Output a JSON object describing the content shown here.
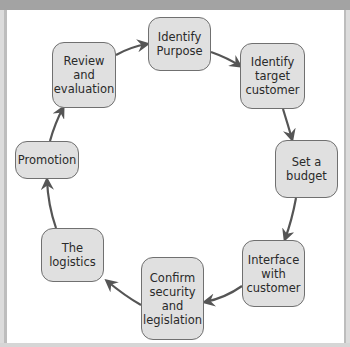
{
  "diagram": {
    "type": "cycle",
    "header_text": "",
    "nodes": [
      {
        "id": "identify-purpose",
        "label": "Identify\nPurpose"
      },
      {
        "id": "identify-target-customer",
        "label": "Identify\ntarget\ncustomer"
      },
      {
        "id": "set-a-budget",
        "label": "Set a\nbudget"
      },
      {
        "id": "interface-with-customer",
        "label": "Interface\nwith\ncustomer"
      },
      {
        "id": "confirm-security-legislation",
        "label": "Confirm\nsecurity\nand\nlegislation"
      },
      {
        "id": "the-logistics",
        "label": "The\nlogistics"
      },
      {
        "id": "promotion",
        "label": "Promotion"
      },
      {
        "id": "review-evaluation",
        "label": "Review\nand\nevaluation"
      }
    ],
    "edges": [
      {
        "from": "identify-purpose",
        "to": "identify-target-customer"
      },
      {
        "from": "identify-target-customer",
        "to": "set-a-budget"
      },
      {
        "from": "set-a-budget",
        "to": "interface-with-customer"
      },
      {
        "from": "interface-with-customer",
        "to": "confirm-security-legislation"
      },
      {
        "from": "confirm-security-legislation",
        "to": "the-logistics"
      },
      {
        "from": "the-logistics",
        "to": "promotion"
      },
      {
        "from": "promotion",
        "to": "review-evaluation"
      },
      {
        "from": "review-evaluation",
        "to": "identify-purpose"
      }
    ],
    "colors": {
      "node_fill": "#e0e0e0",
      "node_border": "#707070",
      "arrow": "#555555",
      "frame": "#a9a9a9",
      "background": "#ffffff"
    }
  }
}
